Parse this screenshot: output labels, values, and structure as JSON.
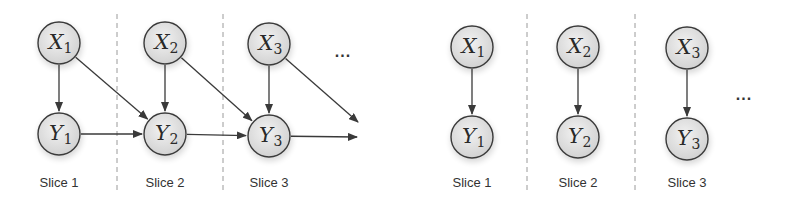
{
  "diagrams": [
    {
      "name": "left-diagram",
      "description": "dynamic model with cross-slice edges",
      "nodes": [
        {
          "id": "X1",
          "var": "X",
          "sub": "1",
          "cx": 59,
          "cy": 43
        },
        {
          "id": "X2",
          "var": "X",
          "sub": "2",
          "cx": 165,
          "cy": 43
        },
        {
          "id": "X3",
          "var": "X",
          "sub": "3",
          "cx": 269,
          "cy": 44
        },
        {
          "id": "Y1",
          "var": "Y",
          "sub": "1",
          "cx": 59,
          "cy": 134
        },
        {
          "id": "Y2",
          "var": "Y",
          "sub": "2",
          "cx": 165,
          "cy": 134
        },
        {
          "id": "Y3",
          "var": "Y",
          "sub": "3",
          "cx": 269,
          "cy": 136
        }
      ],
      "edges": [
        {
          "from": "X1",
          "to": "Y1"
        },
        {
          "from": "X1",
          "to": "Y2"
        },
        {
          "from": "X2",
          "to": "Y2"
        },
        {
          "from": "X2",
          "to": "Y3"
        },
        {
          "from": "X3",
          "to": "Y3"
        },
        {
          "from": "Y1",
          "to": "Y2"
        },
        {
          "from": "Y2",
          "to": "Y3"
        },
        {
          "from": "X3",
          "to": "open",
          "x2": 358,
          "y2": 122
        },
        {
          "from": "Y3",
          "to": "open",
          "x2": 357,
          "y2": 137
        }
      ],
      "dividers_x": [
        117,
        223
      ],
      "slice_labels": [
        {
          "text": "Slice 1",
          "x": 59
        },
        {
          "text": "Slice 2",
          "x": 165
        },
        {
          "text": "Slice 3",
          "x": 269
        }
      ],
      "ellipsis": {
        "text": "...",
        "x": 343,
        "y": 57
      }
    },
    {
      "name": "right-diagram",
      "description": "independent slices",
      "nodes": [
        {
          "id": "X1",
          "var": "X",
          "sub": "1",
          "cx": 472,
          "cy": 47
        },
        {
          "id": "X2",
          "var": "X",
          "sub": "2",
          "cx": 578,
          "cy": 47
        },
        {
          "id": "X3",
          "var": "X",
          "sub": "3",
          "cx": 687,
          "cy": 48
        },
        {
          "id": "Y1",
          "var": "Y",
          "sub": "1",
          "cx": 472,
          "cy": 137
        },
        {
          "id": "Y2",
          "var": "Y",
          "sub": "2",
          "cx": 578,
          "cy": 137
        },
        {
          "id": "Y3",
          "var": "Y",
          "sub": "3",
          "cx": 687,
          "cy": 139
        }
      ],
      "edges": [
        {
          "from": "X1",
          "to": "Y1"
        },
        {
          "from": "X2",
          "to": "Y2"
        },
        {
          "from": "X3",
          "to": "Y3"
        }
      ],
      "dividers_x": [
        527,
        635
      ],
      "slice_labels": [
        {
          "text": "Slice 1",
          "x": 472
        },
        {
          "text": "Slice 2",
          "x": 578
        },
        {
          "text": "Slice 3",
          "x": 687
        }
      ],
      "ellipsis": {
        "text": "...",
        "x": 744,
        "y": 100
      }
    }
  ],
  "style": {
    "node_radius": 21,
    "node_fill_light": "#efefef",
    "node_fill_dark": "#d4d4d4",
    "stroke": "#3a3a3a",
    "divider_color": "#9a9a9a",
    "slice_label_y": 187,
    "divider_top": 14,
    "divider_bottom": 192
  }
}
